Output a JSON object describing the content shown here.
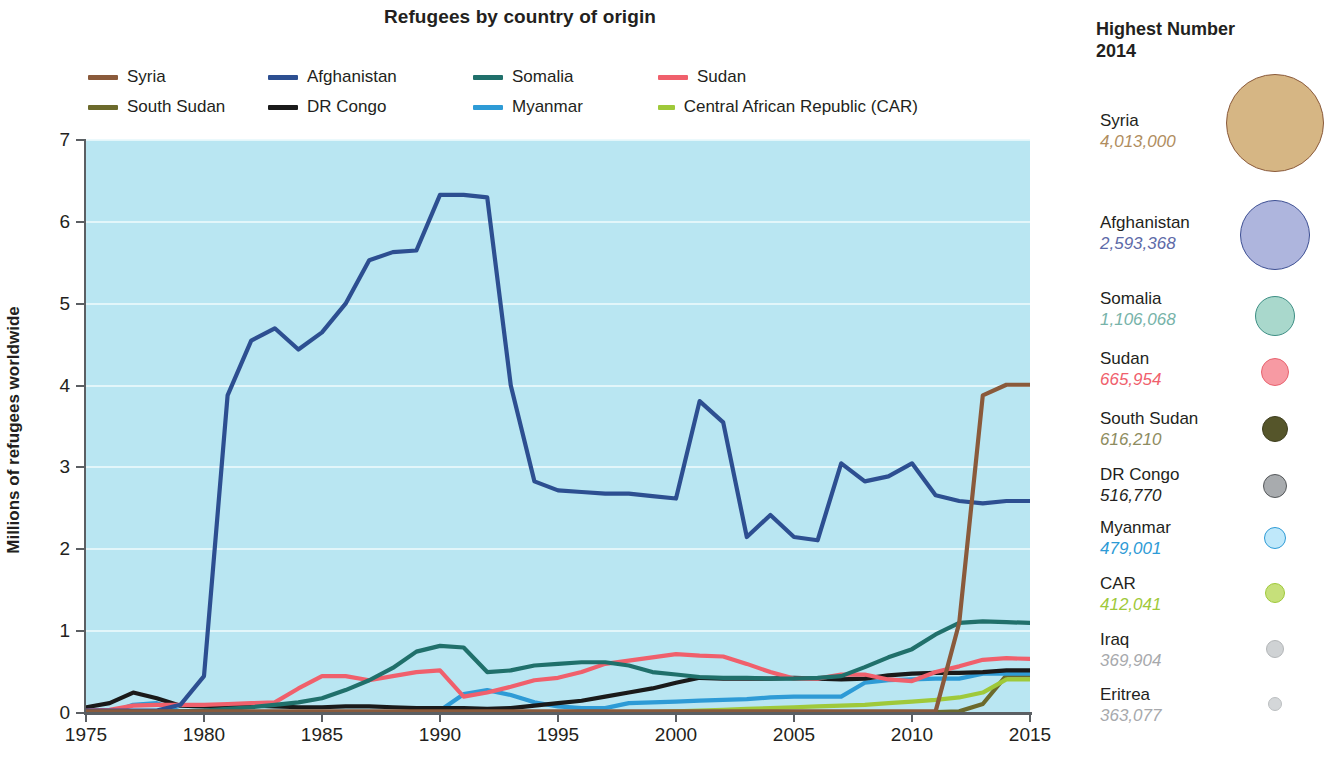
{
  "chart_data": {
    "type": "line",
    "title": "Refugees by country of origin",
    "xlabel": "",
    "ylabel": "Millions of refugees worldwide",
    "xlim": [
      1975,
      2015
    ],
    "ylim": [
      0,
      7
    ],
    "xticks": [
      "1975",
      "1980",
      "1985",
      "1990",
      "1995",
      "2000",
      "2005",
      "2010",
      "2015"
    ],
    "yticks": [
      "0",
      "1",
      "2",
      "3",
      "4",
      "5",
      "6",
      "7"
    ],
    "grid": true,
    "legend_position": "top",
    "plot_background": "#b9e6f2",
    "x": [
      1975,
      1976,
      1977,
      1978,
      1979,
      1980,
      1981,
      1982,
      1983,
      1984,
      1985,
      1986,
      1987,
      1988,
      1989,
      1990,
      1991,
      1992,
      1993,
      1994,
      1995,
      1996,
      1997,
      1998,
      1999,
      2000,
      2001,
      2002,
      2003,
      2004,
      2005,
      2006,
      2007,
      2008,
      2009,
      2010,
      2011,
      2012,
      2013,
      2014,
      2015
    ],
    "series": [
      {
        "name": "Syria",
        "color": "#8a5a3b",
        "values": [
          0.02,
          0.02,
          0.02,
          0.02,
          0.02,
          0.02,
          0.02,
          0.02,
          0.02,
          0.02,
          0.02,
          0.02,
          0.02,
          0.02,
          0.02,
          0.02,
          0.02,
          0.02,
          0.02,
          0.02,
          0.02,
          0.02,
          0.02,
          0.02,
          0.02,
          0.02,
          0.02,
          0.02,
          0.02,
          0.02,
          0.02,
          0.02,
          0.02,
          0.02,
          0.02,
          0.02,
          0.02,
          1.1,
          3.88,
          4.01,
          4.01
        ]
      },
      {
        "name": "Afghanistan",
        "color": "#2d4f91",
        "values": [
          0.03,
          0.03,
          0.03,
          0.03,
          0.1,
          0.45,
          3.88,
          4.55,
          4.7,
          4.44,
          4.65,
          5.0,
          5.53,
          5.63,
          5.65,
          6.33,
          6.33,
          6.3,
          4.0,
          2.83,
          2.72,
          2.7,
          2.68,
          2.68,
          2.65,
          2.62,
          3.81,
          3.55,
          2.15,
          2.42,
          2.15,
          2.11,
          3.05,
          2.83,
          2.89,
          3.05,
          2.66,
          2.59,
          2.56,
          2.59,
          2.59
        ]
      },
      {
        "name": "Somalia",
        "color": "#20706b",
        "values": [
          0.01,
          0.01,
          0.01,
          0.01,
          0.02,
          0.03,
          0.05,
          0.07,
          0.1,
          0.13,
          0.18,
          0.28,
          0.4,
          0.55,
          0.75,
          0.82,
          0.8,
          0.5,
          0.52,
          0.58,
          0.6,
          0.62,
          0.62,
          0.58,
          0.5,
          0.47,
          0.44,
          0.43,
          0.43,
          0.42,
          0.42,
          0.43,
          0.45,
          0.56,
          0.68,
          0.78,
          0.96,
          1.1,
          1.12,
          1.11,
          1.1
        ]
      },
      {
        "name": "Sudan",
        "color": "#f0606c",
        "values": [
          0.03,
          0.04,
          0.09,
          0.1,
          0.1,
          0.1,
          0.11,
          0.12,
          0.13,
          0.3,
          0.45,
          0.45,
          0.4,
          0.45,
          0.5,
          0.52,
          0.2,
          0.25,
          0.32,
          0.4,
          0.43,
          0.5,
          0.6,
          0.64,
          0.68,
          0.72,
          0.7,
          0.69,
          0.6,
          0.5,
          0.42,
          0.42,
          0.47,
          0.47,
          0.41,
          0.39,
          0.5,
          0.57,
          0.65,
          0.67,
          0.66
        ]
      },
      {
        "name": "South Sudan",
        "color": "#6c6a2c",
        "values": [
          0.0,
          0.0,
          0.0,
          0.0,
          0.0,
          0.0,
          0.0,
          0.0,
          0.0,
          0.0,
          0.0,
          0.0,
          0.0,
          0.0,
          0.0,
          0.0,
          0.0,
          0.0,
          0.0,
          0.0,
          0.0,
          0.0,
          0.0,
          0.0,
          0.0,
          0.0,
          0.0,
          0.0,
          0.0,
          0.0,
          0.0,
          0.0,
          0.0,
          0.0,
          0.0,
          0.0,
          0.01,
          0.02,
          0.11,
          0.46,
          0.46
        ]
      },
      {
        "name": "DR Congo",
        "color": "#1a1a1a",
        "values": [
          0.07,
          0.12,
          0.25,
          0.18,
          0.09,
          0.08,
          0.09,
          0.09,
          0.08,
          0.07,
          0.07,
          0.08,
          0.08,
          0.07,
          0.06,
          0.06,
          0.06,
          0.05,
          0.06,
          0.09,
          0.12,
          0.15,
          0.2,
          0.25,
          0.3,
          0.37,
          0.43,
          0.42,
          0.42,
          0.42,
          0.43,
          0.42,
          0.41,
          0.42,
          0.46,
          0.48,
          0.49,
          0.49,
          0.5,
          0.52,
          0.52
        ]
      },
      {
        "name": "Myanmar",
        "color": "#2e9bd6",
        "values": [
          0.0,
          0.0,
          0.1,
          0.12,
          0.02,
          0.01,
          0.01,
          0.01,
          0.01,
          0.01,
          0.01,
          0.01,
          0.01,
          0.01,
          0.01,
          0.03,
          0.23,
          0.28,
          0.22,
          0.13,
          0.08,
          0.06,
          0.06,
          0.12,
          0.13,
          0.14,
          0.15,
          0.16,
          0.17,
          0.19,
          0.2,
          0.2,
          0.2,
          0.37,
          0.4,
          0.41,
          0.42,
          0.42,
          0.48,
          0.48,
          0.48
        ]
      },
      {
        "name": "Central African Republic (CAR)",
        "color": "#9fc93a",
        "values": [
          0.0,
          0.0,
          0.0,
          0.0,
          0.0,
          0.0,
          0.0,
          0.0,
          0.0,
          0.0,
          0.0,
          0.0,
          0.0,
          0.0,
          0.0,
          0.0,
          0.0,
          0.0,
          0.0,
          0.0,
          0.0,
          0.0,
          0.0,
          0.0,
          0.01,
          0.02,
          0.03,
          0.04,
          0.05,
          0.06,
          0.07,
          0.08,
          0.09,
          0.1,
          0.12,
          0.14,
          0.16,
          0.19,
          0.25,
          0.41,
          0.41
        ]
      }
    ]
  },
  "chart": {
    "title": "Refugees by country of origin",
    "axis_title_y": "Millions of refugees worldwide",
    "y_ticks": [
      "7",
      "6",
      "5",
      "4",
      "3",
      "2",
      "1",
      "0"
    ],
    "x_ticks": [
      "1975",
      "1980",
      "1985",
      "1990",
      "1995",
      "2000",
      "2005",
      "2010",
      "2015"
    ],
    "legend": [
      {
        "label": "Syria",
        "color": "#8a5a3b"
      },
      {
        "label": "Afghanistan",
        "color": "#2d4f91"
      },
      {
        "label": "Somalia",
        "color": "#20706b"
      },
      {
        "label": "Sudan",
        "color": "#f0606c"
      },
      {
        "label": "South Sudan",
        "color": "#6c6a2c"
      },
      {
        "label": "DR Congo",
        "color": "#1a1a1a"
      },
      {
        "label": "Myanmar",
        "color": "#2e9bd6"
      },
      {
        "label": "Central African Republic (CAR)",
        "color": "#9fc93a"
      }
    ]
  },
  "bubbles": {
    "title_line1": "Highest Number",
    "title_line2": "2014",
    "items": [
      {
        "name": "Syria",
        "number": "4,013,000",
        "value": 4013000,
        "fill": "#d6b684",
        "stroke": "#8a5a3b",
        "text_color": "#b08d5e",
        "radius": 48
      },
      {
        "name": "Afghanistan",
        "number": "2,593,368",
        "value": 2593368,
        "fill": "#aeb5dd",
        "stroke": "#3d4f93",
        "text_color": "#5d6aa8",
        "radius": 34
      },
      {
        "name": "Somalia",
        "number": "1,106,068",
        "value": 1106068,
        "fill": "#a9d8cc",
        "stroke": "#3d8e84",
        "text_color": "#77b3a9",
        "radius": 19
      },
      {
        "name": "Sudan",
        "number": "665,954",
        "value": 665954,
        "fill": "#f79aa3",
        "stroke": "#e8636f",
        "text_color": "#f0606c",
        "radius": 13
      },
      {
        "name": "South Sudan",
        "number": "616,210",
        "value": 616210,
        "fill": "#55552a",
        "stroke": "#3e3e1e",
        "text_color": "#8e8c60",
        "radius": 12
      },
      {
        "name": "DR Congo",
        "number": "516,770",
        "value": 516770,
        "fill": "#a8abae",
        "stroke": "#55585b",
        "text_color": "#231f20",
        "radius": 11
      },
      {
        "name": "Myanmar",
        "number": "479,001",
        "value": 479001,
        "fill": "#bfe8fa",
        "stroke": "#2e9bd6",
        "text_color": "#2e9bd6",
        "radius": 10
      },
      {
        "name": "CAR",
        "number": "412,041",
        "value": 412041,
        "fill": "#c6e07a",
        "stroke": "#9fc93a",
        "text_color": "#9fc93a",
        "radius": 9
      },
      {
        "name": "Iraq",
        "number": "369,904",
        "value": 369904,
        "fill": "#cfd2d4",
        "stroke": "#b3b6b8",
        "text_color": "#a7a9ac",
        "radius": 8
      },
      {
        "name": "Eritrea",
        "number": "363,077",
        "value": 363077,
        "fill": "#d4d7d9",
        "stroke": "#bcbfc1",
        "text_color": "#a7a9ac",
        "radius": 6
      }
    ]
  }
}
